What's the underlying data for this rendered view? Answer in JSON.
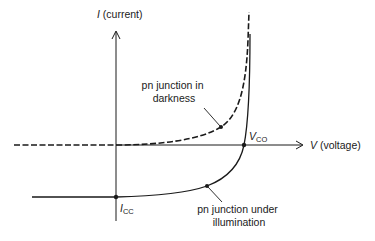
{
  "diagram": {
    "type": "IV characteristic",
    "colors": {
      "stroke": "#1a1a1a",
      "background": "#ffffff"
    },
    "axes": {
      "y": {
        "symbol": "I",
        "label": " (current)"
      },
      "x": {
        "symbol": "V",
        "label": " (voltage)"
      }
    },
    "points": {
      "vco": {
        "main": "V",
        "sub": "CO"
      },
      "icc": {
        "main": "I",
        "sub": "CC"
      }
    },
    "curves": [
      {
        "id": "darkness",
        "style": "dashed",
        "label_line1": "pn junction in",
        "label_line2": "darkness"
      },
      {
        "id": "illumination",
        "style": "solid",
        "label_line1": "pn junction under",
        "label_line2": "illumination"
      }
    ]
  }
}
